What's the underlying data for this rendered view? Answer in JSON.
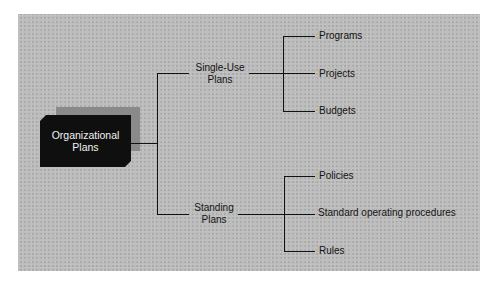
{
  "diagram": {
    "root": {
      "line1": "Organizational",
      "line2": "Plans"
    },
    "branches": [
      {
        "line1": "Single-Use",
        "line2": "Plans",
        "children": [
          "Programs",
          "Projects",
          "Budgets"
        ]
      },
      {
        "line1": "Standing",
        "line2": "Plans",
        "children": [
          "Policies",
          "Standard operating procedures",
          "Rules"
        ]
      }
    ]
  },
  "colors": {
    "panel": "#bdbdbd",
    "root_box": "#0f0f0f",
    "root_shadow": "#8a8a8a",
    "lines": "#111111"
  }
}
